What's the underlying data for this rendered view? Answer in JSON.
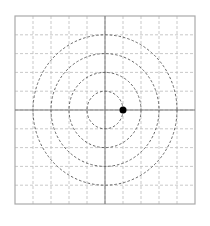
{
  "diagram": {
    "type": "polar-grid",
    "grid": {
      "columns": 10,
      "rows": 10,
      "left": 15,
      "top": 16,
      "width": 180,
      "height": 188,
      "border_color": "#aaaaaa",
      "grid_color": "#bbbbbb"
    },
    "axes": {
      "center_x": 105,
      "center_y": 110,
      "color": "#777777"
    },
    "circles": [
      {
        "radius_cells": 1
      },
      {
        "radius_cells": 2
      },
      {
        "radius_cells": 3
      },
      {
        "radius_cells": 4
      }
    ],
    "circle_color": "#555555",
    "point": {
      "x_cells": 1,
      "y_cells": 0,
      "color": "#000000",
      "radius": 3.5
    }
  }
}
